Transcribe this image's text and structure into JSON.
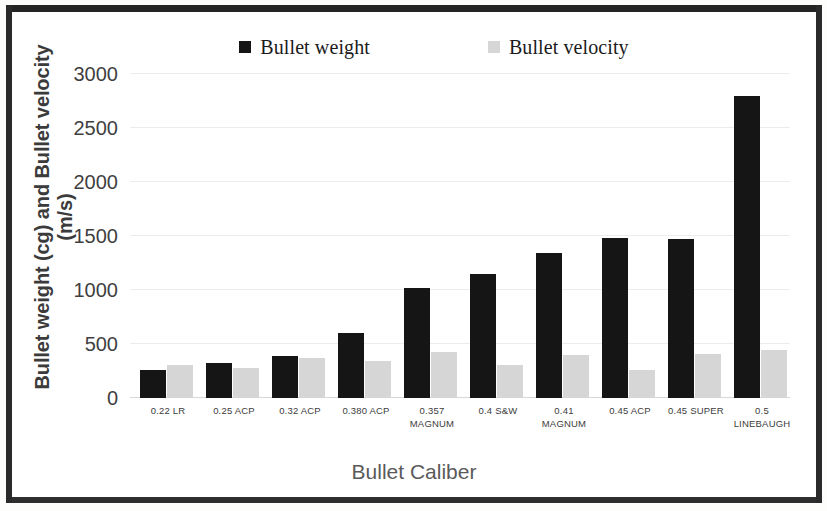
{
  "chart_data": {
    "type": "bar",
    "title": "",
    "xlabel": "Bullet Caliber",
    "ylabel": "Bullet weight (cg) and Bullet velocity (m/s)",
    "ylim": [
      0,
      3000
    ],
    "yticks": [
      0,
      500,
      1000,
      1500,
      2000,
      2500,
      3000
    ],
    "ytick_labels": [
      "0",
      "500",
      "1000",
      "1500",
      "2000",
      "2500",
      "3000"
    ],
    "grid": true,
    "legend_position": "top",
    "categories": [
      "0.22 LR",
      "0.25 ACP",
      "0.32 ACP",
      "0.380 ACP",
      "0.357 MAGNUM",
      "0.4 S&W",
      "0.41 MAGNUM",
      "0.45 ACP",
      "0.45 SUPER",
      "0.5 LINEBAUGH"
    ],
    "category_lines": [
      [
        "0.22 LR",
        ""
      ],
      [
        "0.25 ACP",
        ""
      ],
      [
        "0.32 ACP",
        ""
      ],
      [
        "0.380 ACP",
        ""
      ],
      [
        "0.357",
        "MAGNUM"
      ],
      [
        "0.4 S&W",
        ""
      ],
      [
        "0.41",
        "MAGNUM"
      ],
      [
        "0.45 ACP",
        ""
      ],
      [
        "0.45 SUPER",
        ""
      ],
      [
        "0.5",
        "LINEBAUGH"
      ]
    ],
    "series": [
      {
        "name": "Bullet weight",
        "unit": "cg",
        "color": "#151515",
        "values": [
          260,
          320,
          385,
          600,
          1020,
          1150,
          1340,
          1480,
          1470,
          2800
        ]
      },
      {
        "name": "Bullet velocity",
        "unit": "m/s",
        "color": "#d6d6d6",
        "values": [
          310,
          280,
          375,
          340,
          425,
          310,
          400,
          255,
          410,
          445
        ]
      }
    ]
  },
  "legend": {
    "items": [
      {
        "label": "Bullet weight",
        "color": "#151515"
      },
      {
        "label": "Bullet velocity",
        "color": "#d6d6d6"
      }
    ]
  },
  "axes": {
    "y_title": "Bullet weight (cg) and Bullet velocity (m/s)",
    "x_title": "Bullet Caliber"
  }
}
